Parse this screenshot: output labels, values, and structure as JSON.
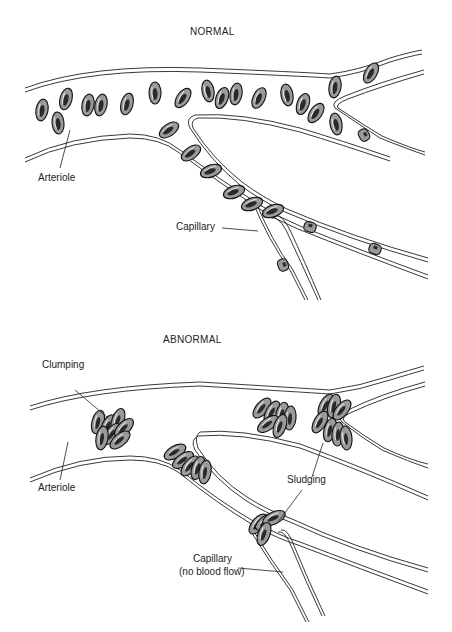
{
  "normal": {
    "title": "NORMAL",
    "labels": {
      "arteriole": "Arteriole",
      "capillary": "Capillary"
    }
  },
  "abnormal": {
    "title": "ABNORMAL",
    "labels": {
      "clumping": "Clumping",
      "arteriole": "Arteriole",
      "sludging": "Sludging",
      "capillary_line1": "Capillary",
      "capillary_line2": "(no blood flow)"
    }
  },
  "colors": {
    "line": "#222222",
    "cell_fill": "#9a9a9a",
    "cell_outline": "#111111",
    "background": "#ffffff"
  }
}
